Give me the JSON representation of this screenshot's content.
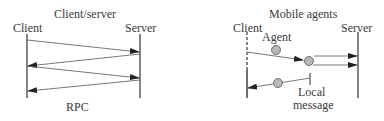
{
  "left_panel": {
    "title": "Client/server",
    "client_label": "Client",
    "server_label": "Server",
    "caption": "RPC"
  },
  "right_panel": {
    "title": "Mobile agents",
    "client_label": "Client",
    "server_label": "Server",
    "agent_label": "Agent",
    "local_message_line1": "Local",
    "local_message_line2": "message"
  },
  "colors": {
    "line": "#333333",
    "agent_fill": "#b8b8b8",
    "agent_stroke": "#555555"
  }
}
